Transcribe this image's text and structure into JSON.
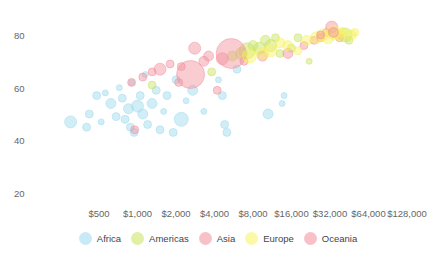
{
  "chart_data": {
    "type": "scatter",
    "subtype": "bubble",
    "title": "",
    "xlabel": "",
    "ylabel": "",
    "x_scale": "log2",
    "x_ticks": [
      "$500",
      "$1,000",
      "$2,000",
      "$4,000",
      "$8,000",
      "$16,000",
      "$32,000",
      "$64,000",
      "$128,000"
    ],
    "x_tick_values": [
      500,
      1000,
      2000,
      4000,
      8000,
      16000,
      32000,
      64000,
      128000
    ],
    "y_ticks": [
      "80",
      "60",
      "40",
      "20"
    ],
    "y_tick_values": [
      80,
      60,
      40,
      20
    ],
    "ylim": [
      20,
      85
    ],
    "grid": false,
    "legend_position": "bottom",
    "legend": [
      {
        "name": "Africa",
        "color": "#9ad9ee"
      },
      {
        "name": "Americas",
        "color": "#c7e35a"
      },
      {
        "name": "Asia",
        "color": "#f28e9b"
      },
      {
        "name": "Europe",
        "color": "#f7f25c"
      },
      {
        "name": "Oceania",
        "color": "#f28e9b"
      }
    ],
    "series": [
      {
        "name": "Africa",
        "color": "#9ad9ee",
        "points": [
          {
            "x": 300,
            "y": 47,
            "r": 6
          },
          {
            "x": 400,
            "y": 45,
            "r": 4
          },
          {
            "x": 420,
            "y": 50,
            "r": 4
          },
          {
            "x": 520,
            "y": 47,
            "r": 3
          },
          {
            "x": 480,
            "y": 57,
            "r": 4
          },
          {
            "x": 560,
            "y": 58,
            "r": 3
          },
          {
            "x": 620,
            "y": 54,
            "r": 5
          },
          {
            "x": 680,
            "y": 49,
            "r": 4
          },
          {
            "x": 720,
            "y": 60,
            "r": 3
          },
          {
            "x": 760,
            "y": 56,
            "r": 4
          },
          {
            "x": 800,
            "y": 48,
            "r": 4
          },
          {
            "x": 850,
            "y": 52,
            "r": 5
          },
          {
            "x": 880,
            "y": 45,
            "r": 4
          },
          {
            "x": 900,
            "y": 62,
            "r": 3
          },
          {
            "x": 940,
            "y": 43,
            "r": 4
          },
          {
            "x": 1000,
            "y": 53,
            "r": 6
          },
          {
            "x": 1050,
            "y": 57,
            "r": 4
          },
          {
            "x": 1100,
            "y": 50,
            "r": 5
          },
          {
            "x": 1150,
            "y": 65,
            "r": 3
          },
          {
            "x": 1200,
            "y": 46,
            "r": 4
          },
          {
            "x": 1300,
            "y": 54,
            "r": 5
          },
          {
            "x": 1400,
            "y": 59,
            "r": 4
          },
          {
            "x": 1500,
            "y": 44,
            "r": 4
          },
          {
            "x": 1600,
            "y": 51,
            "r": 3
          },
          {
            "x": 1700,
            "y": 57,
            "r": 4
          },
          {
            "x": 1900,
            "y": 43,
            "r": 4
          },
          {
            "x": 2000,
            "y": 63,
            "r": 4
          },
          {
            "x": 2200,
            "y": 48,
            "r": 7
          },
          {
            "x": 2400,
            "y": 55,
            "r": 3
          },
          {
            "x": 2700,
            "y": 59,
            "r": 5
          },
          {
            "x": 3300,
            "y": 51,
            "r": 3
          },
          {
            "x": 4800,
            "y": 46,
            "r": 4
          },
          {
            "x": 5000,
            "y": 43,
            "r": 4
          },
          {
            "x": 4600,
            "y": 57,
            "r": 4
          },
          {
            "x": 4300,
            "y": 63,
            "r": 3
          },
          {
            "x": 10500,
            "y": 50,
            "r": 5
          },
          {
            "x": 13500,
            "y": 54,
            "r": 3
          },
          {
            "x": 14000,
            "y": 57,
            "r": 3
          },
          {
            "x": 6000,
            "y": 67,
            "r": 4
          }
        ]
      },
      {
        "name": "Americas",
        "color": "#c7e35a",
        "points": [
          {
            "x": 1300,
            "y": 61,
            "r": 4
          },
          {
            "x": 3800,
            "y": 66,
            "r": 4
          },
          {
            "x": 5500,
            "y": 72,
            "r": 5
          },
          {
            "x": 6500,
            "y": 73,
            "r": 6
          },
          {
            "x": 7200,
            "y": 74,
            "r": 8
          },
          {
            "x": 8000,
            "y": 76,
            "r": 5
          },
          {
            "x": 9000,
            "y": 75,
            "r": 6
          },
          {
            "x": 10000,
            "y": 78,
            "r": 5
          },
          {
            "x": 11000,
            "y": 76,
            "r": 6
          },
          {
            "x": 12000,
            "y": 79,
            "r": 4
          },
          {
            "x": 13000,
            "y": 73,
            "r": 4
          },
          {
            "x": 16000,
            "y": 75,
            "r": 4
          },
          {
            "x": 18000,
            "y": 79,
            "r": 4
          },
          {
            "x": 22000,
            "y": 70,
            "r": 3
          },
          {
            "x": 42000,
            "y": 80,
            "r": 7
          },
          {
            "x": 45000,
            "y": 78,
            "r": 4
          }
        ]
      },
      {
        "name": "Asia",
        "color": "#f28e9b",
        "points": [
          {
            "x": 950,
            "y": 44,
            "r": 4
          },
          {
            "x": 900,
            "y": 62,
            "r": 4
          },
          {
            "x": 1100,
            "y": 64,
            "r": 4
          },
          {
            "x": 1300,
            "y": 66,
            "r": 4
          },
          {
            "x": 1500,
            "y": 67,
            "r": 6
          },
          {
            "x": 1800,
            "y": 69,
            "r": 4
          },
          {
            "x": 2100,
            "y": 62,
            "r": 4
          },
          {
            "x": 2200,
            "y": 68,
            "r": 4
          },
          {
            "x": 2600,
            "y": 65,
            "r": 14
          },
          {
            "x": 2800,
            "y": 75,
            "r": 6
          },
          {
            "x": 3300,
            "y": 70,
            "r": 5
          },
          {
            "x": 3600,
            "y": 72,
            "r": 5
          },
          {
            "x": 4200,
            "y": 59,
            "r": 4
          },
          {
            "x": 4600,
            "y": 71,
            "r": 6
          },
          {
            "x": 5400,
            "y": 73,
            "r": 15
          },
          {
            "x": 6800,
            "y": 70,
            "r": 4
          },
          {
            "x": 9500,
            "y": 72,
            "r": 5
          },
          {
            "x": 15000,
            "y": 73,
            "r": 5
          },
          {
            "x": 20000,
            "y": 76,
            "r": 4
          },
          {
            "x": 24000,
            "y": 78,
            "r": 4
          },
          {
            "x": 27000,
            "y": 79,
            "r": 4
          },
          {
            "x": 30000,
            "y": 81,
            "r": 4
          },
          {
            "x": 33000,
            "y": 83,
            "r": 6
          },
          {
            "x": 38000,
            "y": 79,
            "r": 4
          }
        ]
      },
      {
        "name": "Europe",
        "color": "#f7f25c",
        "points": [
          {
            "x": 7500,
            "y": 72,
            "r": 7
          },
          {
            "x": 9500,
            "y": 73,
            "r": 6
          },
          {
            "x": 11000,
            "y": 74,
            "r": 6
          },
          {
            "x": 13000,
            "y": 77,
            "r": 5
          },
          {
            "x": 15000,
            "y": 76,
            "r": 5
          },
          {
            "x": 18000,
            "y": 74,
            "r": 4
          },
          {
            "x": 21000,
            "y": 78,
            "r": 5
          },
          {
            "x": 25000,
            "y": 79,
            "r": 6
          },
          {
            "x": 28000,
            "y": 80,
            "r": 6
          },
          {
            "x": 31000,
            "y": 79,
            "r": 6
          },
          {
            "x": 34000,
            "y": 81,
            "r": 7
          },
          {
            "x": 38000,
            "y": 80,
            "r": 6
          },
          {
            "x": 40000,
            "y": 81,
            "r": 5
          },
          {
            "x": 47000,
            "y": 80,
            "r": 5
          },
          {
            "x": 50000,
            "y": 81,
            "r": 4
          }
        ]
      },
      {
        "name": "Oceania",
        "color": "#f28e9b",
        "points": [
          {
            "x": 34000,
            "y": 81,
            "r": 5
          },
          {
            "x": 27000,
            "y": 80,
            "r": 4
          }
        ]
      }
    ]
  }
}
